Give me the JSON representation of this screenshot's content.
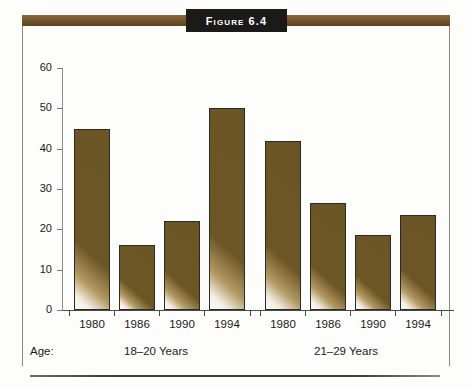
{
  "figure": {
    "title": "Figure 6.4",
    "age_label": "Age:",
    "band_color": "#6f5128",
    "plaque_color": "#1c1a18",
    "bar_color": "#6b5524"
  },
  "chart_data": {
    "type": "bar",
    "title": "Figure 6.4",
    "xlabel": "Age:",
    "ylabel": "",
    "ylim": [
      0,
      60
    ],
    "yticks": [
      0,
      10,
      20,
      30,
      40,
      50,
      60
    ],
    "grid": false,
    "legend": "none",
    "categories": [
      "1980",
      "1986",
      "1990",
      "1994",
      "1980",
      "1986",
      "1990",
      "1994"
    ],
    "values": [
      45,
      16,
      22,
      50,
      42,
      26.5,
      18.5,
      23.5
    ],
    "groups": [
      {
        "label": "18–20 Years",
        "categories": [
          "1980",
          "1986",
          "1990",
          "1994"
        ],
        "values": [
          45,
          16,
          22,
          50
        ]
      },
      {
        "label": "21–29 Years",
        "categories": [
          "1980",
          "1986",
          "1990",
          "1994"
        ],
        "values": [
          42,
          26.5,
          18.5,
          23.5
        ]
      }
    ]
  }
}
